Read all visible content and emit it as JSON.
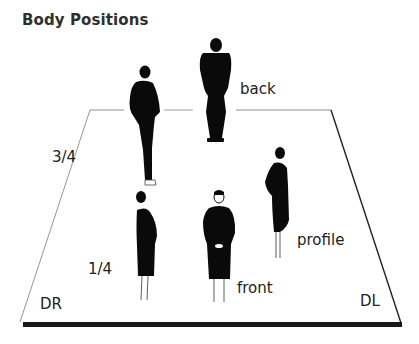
{
  "title": "Body Positions",
  "labels": {
    "back": "back",
    "three_quarter": "3/4",
    "one_quarter": "1/4",
    "profile": "profile",
    "front": "front",
    "downstage_right": "DR",
    "downstage_left": "DL"
  },
  "figures": [
    {
      "position": "back",
      "icon": "figure-back-icon"
    },
    {
      "position": "3/4",
      "icon": "figure-three-quarter-icon"
    },
    {
      "position": "1/4",
      "icon": "figure-one-quarter-icon"
    },
    {
      "position": "profile",
      "icon": "figure-profile-icon"
    },
    {
      "position": "front",
      "icon": "figure-front-icon"
    }
  ],
  "colors": {
    "figure": "#0a0a0a",
    "stage_edge": "#9a9a9a",
    "stage_front": "#1a1a1a"
  }
}
